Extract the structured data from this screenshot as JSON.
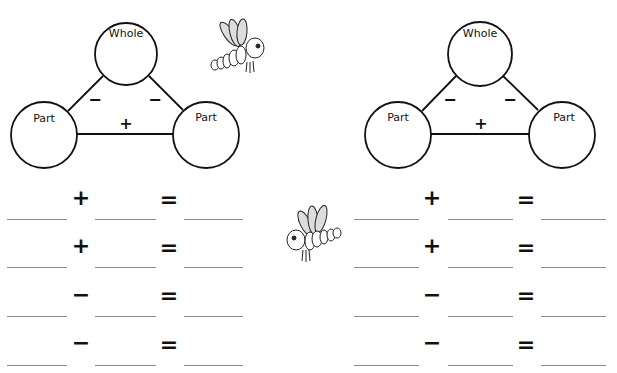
{
  "diagrams": [
    {
      "whole_label": "Whole",
      "part_left_label": "Part",
      "part_right_label": "Part",
      "minus_left": "−",
      "minus_right": "−",
      "plus": "+"
    },
    {
      "whole_label": "Whole",
      "part_left_label": "Part",
      "part_right_label": "Part",
      "minus_left": "−",
      "minus_right": "−",
      "plus": "+"
    }
  ],
  "decorations": {
    "top_icon": "dragonfly-icon",
    "middle_icon": "dragonfly-icon"
  },
  "equations_left": [
    {
      "operator": "+",
      "equals": "="
    },
    {
      "operator": "+",
      "equals": "="
    },
    {
      "operator": "−",
      "equals": "="
    },
    {
      "operator": "−",
      "equals": "="
    }
  ],
  "equations_right": [
    {
      "operator": "+",
      "equals": "="
    },
    {
      "operator": "+",
      "equals": "="
    },
    {
      "operator": "−",
      "equals": "="
    },
    {
      "operator": "−",
      "equals": "="
    }
  ]
}
